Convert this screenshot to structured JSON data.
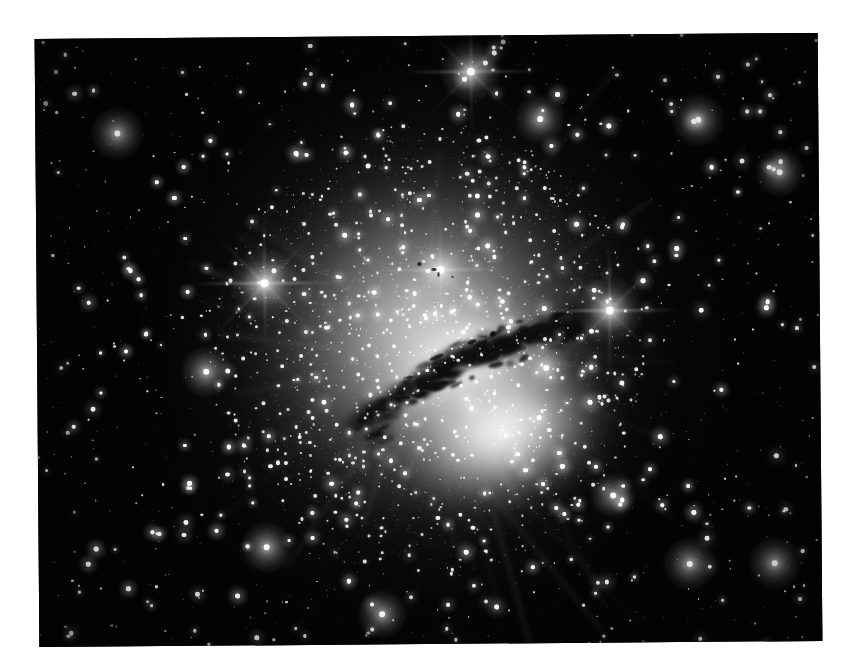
{
  "page": {
    "background_color": "#ffffff",
    "width": 857,
    "height": 672
  },
  "photo": {
    "name": "astronomical-photograph",
    "subject": "Centaurus A (NGC 5128) elliptical galaxy with dark dust lane",
    "medium": "grayscale astronomical image",
    "rotation_degrees": -0.45,
    "frame": {
      "left": 37,
      "top": 36,
      "width": 783,
      "height": 608
    },
    "background_sky_color": "#030303",
    "caption": ""
  },
  "chart_data": {
    "type": "scatter",
    "title": "",
    "xlabel": "",
    "ylabel": "",
    "note": "star field positions and relative brightness",
    "bright_stars": [
      {
        "x": 265,
        "y": 282,
        "mag": 1.0,
        "spikes": true
      },
      {
        "x": 610,
        "y": 312,
        "mag": 0.95,
        "spikes": true
      },
      {
        "x": 473,
        "y": 72,
        "mag": 0.85,
        "spikes": true
      },
      {
        "x": 441,
        "y": 270,
        "mag": 0.8,
        "spikes": true
      },
      {
        "x": 119,
        "y": 131,
        "mag": 0.7,
        "spikes": false
      },
      {
        "x": 700,
        "y": 122,
        "mag": 0.7,
        "spikes": false
      },
      {
        "x": 773,
        "y": 566,
        "mag": 0.7,
        "spikes": false
      },
      {
        "x": 688,
        "y": 566,
        "mag": 0.7,
        "spikes": false
      },
      {
        "x": 265,
        "y": 546,
        "mag": 0.65,
        "spikes": false
      },
      {
        "x": 206,
        "y": 370,
        "mag": 0.65,
        "spikes": false
      },
      {
        "x": 542,
        "y": 120,
        "mag": 0.6,
        "spikes": false
      },
      {
        "x": 546,
        "y": 369,
        "mag": 0.6,
        "spikes": false
      },
      {
        "x": 781,
        "y": 175,
        "mag": 0.6,
        "spikes": false
      },
      {
        "x": 380,
        "y": 614,
        "mag": 0.6,
        "spikes": false
      },
      {
        "x": 612,
        "y": 497,
        "mag": 0.55,
        "spikes": false
      }
    ]
  },
  "galaxy": {
    "name": "NGC 5128",
    "halo": {
      "cx": 428,
      "cy": 348,
      "rx": 205,
      "ry": 215
    },
    "core_upper": {
      "cx": 437,
      "cy": 323,
      "rx": 105,
      "ry": 75
    },
    "core_lower": {
      "cx": 467,
      "cy": 412,
      "rx": 115,
      "ry": 82
    },
    "dust_lane": {
      "angle_degrees": -17,
      "start": {
        "x": 340,
        "y": 380
      },
      "end": {
        "x": 560,
        "y": 312
      },
      "color": "#0e0e0e"
    }
  }
}
